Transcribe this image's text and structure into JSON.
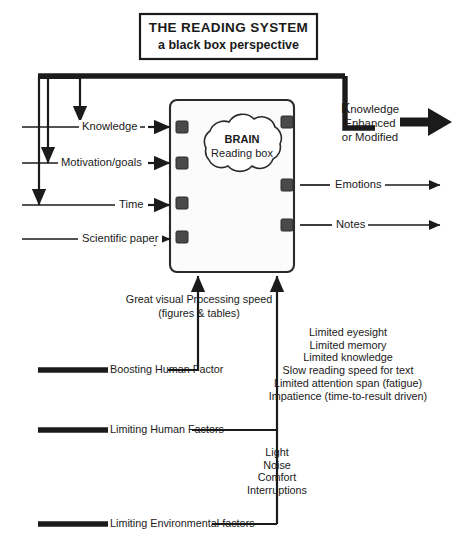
{
  "title": {
    "main": "THE READING SYSTEM",
    "subtitle": "a black box perspective"
  },
  "central_box": {
    "cloud_line1": "BRAIN",
    "cloud_line2": "Reading box"
  },
  "inputs": [
    {
      "label": "Knowledge"
    },
    {
      "label": "Motivation/goals"
    },
    {
      "label": "Time"
    },
    {
      "label": "Scientific paper"
    }
  ],
  "outputs": [
    {
      "label_line1": "K",
      "label_line1_rest": "nowledge",
      "label_line2": "Enhanced",
      "label_line3": "or Modified",
      "emphasis": "primary"
    },
    {
      "label": "Emotions",
      "emphasis": "normal"
    },
    {
      "label": "Notes",
      "emphasis": "normal"
    }
  ],
  "boosting": {
    "factor_label": "Boosting Human Factor",
    "note_line1": "Great visual Processing speed",
    "note_line2": "(figures & tables)"
  },
  "limiting_human": {
    "factor_label": "Limiting Human Factors",
    "items": [
      "Limited eyesight",
      "Limited memory",
      "Limited knowledge",
      "Slow reading speed for text",
      "Limited attention span (fatigue)",
      "Impatience (time-to-result driven)"
    ]
  },
  "limiting_environmental": {
    "factor_label": "Limiting Environmental factors",
    "items": [
      "Light",
      "Noise",
      "Comfort",
      "Interruptions"
    ]
  },
  "colors": {
    "ink": "#1b1b1b",
    "box_fill": "#fbfbfb",
    "port": "#4a4a4a",
    "background": "#ffffff"
  }
}
